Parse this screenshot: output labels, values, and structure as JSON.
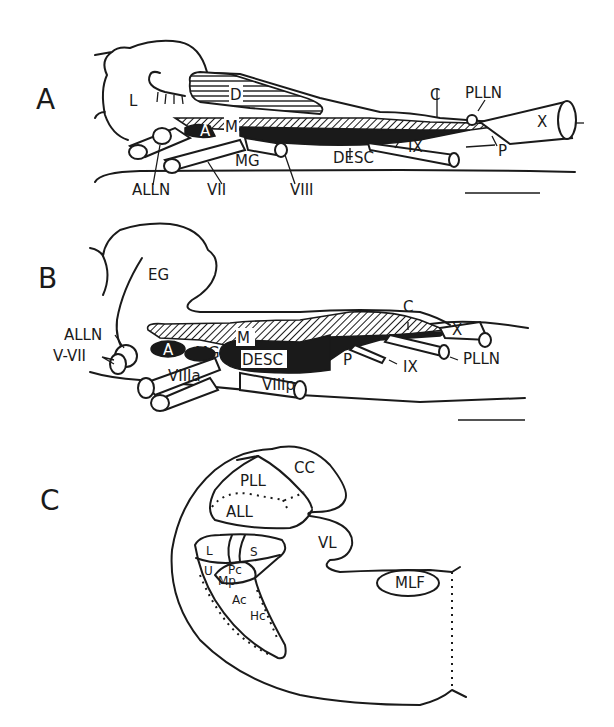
{
  "figure": {
    "panels": [
      {
        "id": "A",
        "label": "A",
        "structures": {
          "L": "L",
          "D": "D",
          "A": "A",
          "M": "M",
          "MG": "MG",
          "DESC": "DESC",
          "C": "C",
          "P": "P",
          "X": "X",
          "IX": "IX",
          "VII": "VII",
          "VIII": "VIII",
          "ALLN": "ALLN",
          "PLLN": "PLLN"
        },
        "scale_bar": true
      },
      {
        "id": "B",
        "label": "B",
        "structures": {
          "EG": "EG",
          "ALLN": "ALLN",
          "V_VII": "V-VII",
          "A": "A",
          "MG": "MG",
          "M": "M",
          "DESC": "DESC",
          "VIIIa": "VIIIa",
          "VIIIp": "VIIIp",
          "C": "C",
          "P": "P",
          "IX": "IX",
          "X": "X",
          "PLLN": "PLLN"
        },
        "scale_bar": true
      },
      {
        "id": "C",
        "label": "C",
        "structures": {
          "CC": "CC",
          "PLL": "PLL",
          "ALL": "ALL",
          "VL": "VL",
          "MLF": "MLF",
          "L": "L",
          "S": "S",
          "U": "U",
          "Pc": "Pc",
          "Mp": "Mp",
          "Ac": "Ac",
          "Hc": "Hc"
        },
        "scale_bar": false
      }
    ]
  }
}
